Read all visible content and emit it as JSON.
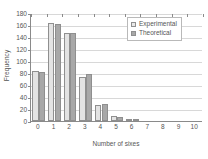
{
  "chart_data": {
    "type": "bar",
    "title": "",
    "xlabel": "Number of sixes",
    "ylabel": "Frequency",
    "categories": [
      "0",
      "1",
      "2",
      "3",
      "4",
      "5",
      "6",
      "7",
      "8",
      "9",
      "10"
    ],
    "series": [
      {
        "name": "Experimental",
        "color": "#e3e3e3",
        "values": [
          84,
          163,
          146,
          73,
          26,
          8,
          1,
          0,
          0,
          0,
          0
        ]
      },
      {
        "name": "Theoretical",
        "color": "#a8a8a8",
        "values": [
          81,
          162,
          146,
          78,
          29,
          7,
          1,
          0,
          0,
          0,
          0
        ]
      }
    ],
    "ylim": [
      0,
      180
    ],
    "yticks": [
      0,
      20,
      40,
      60,
      80,
      100,
      120,
      140,
      160,
      180
    ],
    "ytick_labels": [
      "0",
      "20",
      "40",
      "60",
      "80",
      "100",
      "120",
      "140",
      "160",
      "180"
    ],
    "grid": true,
    "legend_position": "top-right",
    "legend": [
      {
        "label": "Experimental",
        "swatch": "light-gray-square"
      },
      {
        "label": "Theoretical",
        "swatch": "dark-gray-square"
      }
    ]
  },
  "colors": {
    "experimental": "#e3e3e3",
    "theoretical": "#a8a8a8",
    "axis": "#8a8a8a",
    "grid": "#d8d8d8",
    "text": "#555555",
    "background": "#ffffff"
  }
}
